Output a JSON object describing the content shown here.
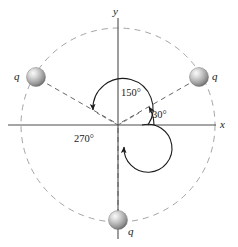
{
  "figure": {
    "background": "#ffffff",
    "axes": {
      "x_label": "x",
      "y_label": "y",
      "color": "#4d4d4d"
    },
    "circle": {
      "style": "dashed",
      "color": "#9a9a9a",
      "center_x": 118,
      "center_y": 125,
      "radius": 97
    },
    "charges": [
      {
        "id": "charge-right",
        "label": "q",
        "angle_deg": 30,
        "cx": 199,
        "cy": 77,
        "r": 9.5,
        "label_x": 212,
        "label_y": 80
      },
      {
        "id": "charge-left",
        "label": "q",
        "angle_deg": 150,
        "cx": 36,
        "cy": 77,
        "r": 9.5,
        "label_x": 16,
        "label_y": 80
      },
      {
        "id": "charge-bottom",
        "label": "q",
        "angle_deg": 270,
        "cx": 118,
        "cy": 220,
        "r": 9.5,
        "label_x": 131,
        "label_y": 233
      }
    ],
    "angles": [
      {
        "id": "angle-30",
        "label": "30°",
        "value_deg": 30,
        "arc_radius": 36,
        "label_x": 155,
        "label_y": 115
      },
      {
        "id": "angle-150",
        "label": "150°",
        "value_deg": 150,
        "arc_radius": 30,
        "label_x": 103,
        "label_y": 94
      },
      {
        "id": "angle-270",
        "label": "270°",
        "value_deg": 270,
        "arc_radius": 24,
        "label_x": 77,
        "label_y": 140
      }
    ],
    "sphere_colors": {
      "highlight": "#f2f2f2",
      "mid": "#b8b8b8",
      "shadow": "#6e6e6e"
    },
    "line_colors": {
      "leader_dashed": "#555555",
      "arc": "#1a1a1a"
    }
  }
}
